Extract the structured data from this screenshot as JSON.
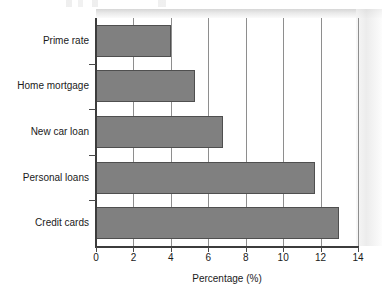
{
  "chart_data": {
    "type": "bar",
    "orientation": "horizontal",
    "title": "",
    "xlabel": "Percentage (%)",
    "ylabel": "",
    "categories": [
      "Prime rate",
      "Home mortgage",
      "New car loan",
      "Personal loans",
      "Credit cards"
    ],
    "values": [
      4.0,
      5.3,
      6.8,
      11.7,
      13.0
    ],
    "series": [
      {
        "name": "Percentage",
        "values": [
          4.0,
          5.3,
          6.8,
          11.7,
          13.0
        ]
      }
    ],
    "xlim": [
      0,
      14
    ],
    "xticks": [
      0,
      2,
      4,
      6,
      8,
      10,
      12,
      14
    ],
    "xtick_labels": [
      "0",
      "2",
      "4",
      "6",
      "8",
      "10",
      "12",
      "14"
    ],
    "grid": "vertical",
    "legend": "none",
    "bar_color": "#808080",
    "bar_edge_color": "#4f4f4f",
    "axis_color": "#3c3c3c",
    "gridline_color": "#8e8e8e",
    "background": "#ffffff",
    "bar_order_top_to_bottom": [
      "Prime rate",
      "Home mortgage",
      "New car loan",
      "Personal loans",
      "Credit cards"
    ]
  }
}
